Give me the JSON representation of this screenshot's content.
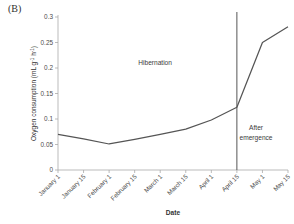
{
  "panel": {
    "label": "(B)"
  },
  "chart_data": {
    "type": "line",
    "title": "",
    "xlabel": "Date",
    "ylabel": "Oxygen consumption (mL g",
    "ylabel_sup1": "-1",
    "ylabel_mid": " h",
    "ylabel_sup2": "-1",
    "ylabel_end": ")",
    "ylabel_full": "Oxygen consumption (mL g-1 h-1)",
    "categories": [
      "January 1",
      "January 15",
      "February 1",
      "February 15",
      "March 1",
      "March 15",
      "April 1",
      "April 15",
      "May 1",
      "May 15"
    ],
    "x": [
      0,
      1,
      2,
      3,
      4,
      5,
      6,
      7,
      8,
      9
    ],
    "values": [
      0.07,
      0.061,
      0.051,
      0.06,
      0.07,
      0.08,
      0.098,
      0.123,
      0.25,
      0.281
    ],
    "ylim": [
      0,
      0.3
    ],
    "yticks": [
      0,
      0.05,
      0.1,
      0.15,
      0.2,
      0.25,
      0.3
    ],
    "ytick_labels": [
      "0",
      "0.05",
      "0.1",
      "0.15",
      "0.2",
      "0.25",
      "0.3"
    ],
    "grid": false,
    "legend": "none",
    "series_color": "#555555",
    "axis_color": "#aaaaaa",
    "annotations": [
      {
        "text": "Hibernation",
        "x": 3.8,
        "y": 0.205
      },
      {
        "text": "After",
        "x": 7.75,
        "y": 0.078
      },
      {
        "text": "emergence",
        "x": 7.75,
        "y": 0.058
      }
    ],
    "vertical_divider": {
      "x": 7,
      "label": "April 15",
      "color": "#555555"
    }
  }
}
